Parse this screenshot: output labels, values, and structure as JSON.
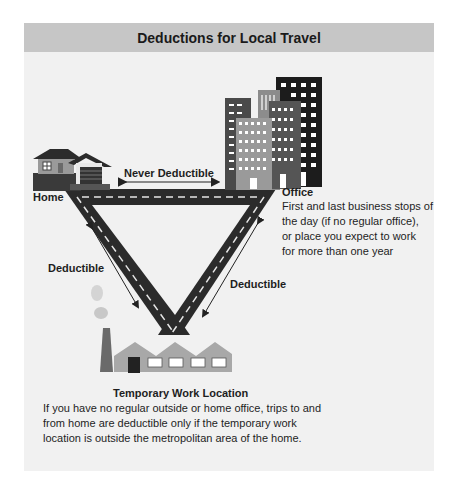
{
  "title": "Deductions for Local Travel",
  "nodes": {
    "home": {
      "label": "Home",
      "icon": "house-icon"
    },
    "office": {
      "label": "Office",
      "icon": "office-buildings-icon",
      "description_lines": [
        "First and last business stops of",
        "the day (if no regular office),",
        "or place you expect to work",
        "for more than one year"
      ]
    },
    "temporary_work_location": {
      "label": "Temporary Work Location",
      "icon": "factory-icon",
      "description_lines": [
        "If you have no regular outside or home office, trips to and",
        "from home are deductible only if the temporary work",
        "location is outside the metropolitan area of the home."
      ]
    }
  },
  "edges": {
    "home_office": {
      "label": "Never Deductible"
    },
    "home_temp": {
      "label": "Deductible"
    },
    "office_temp": {
      "label": "Deductible"
    }
  },
  "colors": {
    "header_bg": "#c6c6c6",
    "panel_bg": "#f1f1f1",
    "road": "#2b2b2b",
    "road_dash": "#e6e6e6",
    "building_dark": "#1c1c1c",
    "building_mid": "#5a5a5a",
    "building_light": "#8c8c8c",
    "factory": "#a8a8a8"
  }
}
